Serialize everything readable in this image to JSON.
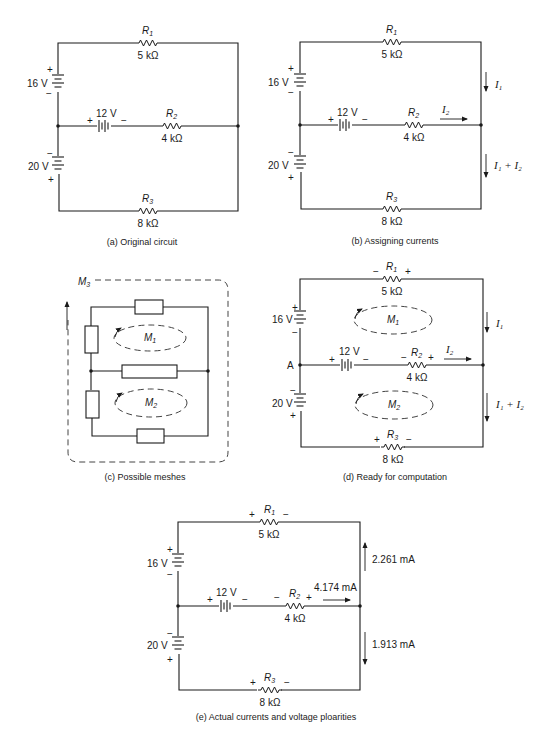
{
  "figure": {
    "panels": [
      {
        "id": "a",
        "caption": "(a)  Original circuit",
        "R1": {
          "name": "R",
          "sub": "1",
          "value": "5 kΩ"
        },
        "R2": {
          "name": "R",
          "sub": "2",
          "value": "4 kΩ"
        },
        "R3": {
          "name": "R",
          "sub": "3",
          "value": "8 kΩ"
        },
        "V16": {
          "value": "16 V",
          "top": "+",
          "bottom": "−"
        },
        "V20": {
          "value": "20 V",
          "top": "−",
          "bottom": "+"
        },
        "V12": {
          "value": "12 V",
          "left": "+",
          "right": "−"
        }
      },
      {
        "id": "b",
        "caption": "(b)  Assigning currents",
        "R1": {
          "name": "R",
          "sub": "1",
          "value": "5 kΩ"
        },
        "R2": {
          "name": "R",
          "sub": "2",
          "value": "4 kΩ"
        },
        "R3": {
          "name": "R",
          "sub": "3",
          "value": "8 kΩ"
        },
        "V16": {
          "value": "16 V",
          "top": "+",
          "bottom": "−"
        },
        "V20": {
          "value": "20 V",
          "top": "−",
          "bottom": "+"
        },
        "V12": {
          "value": "12 V",
          "left": "+",
          "right": "−"
        },
        "currents": {
          "I1": "I",
          "I1_sub": "1",
          "I2": "I",
          "I2_sub": "2",
          "I1plusI2": "I₁ + I₂"
        }
      },
      {
        "id": "c",
        "caption": "(c)  Possible meshes",
        "meshes": {
          "M1": "M",
          "M1_sub": "1",
          "M2": "M",
          "M2_sub": "2",
          "M3": "M",
          "M3_sub": "3"
        }
      },
      {
        "id": "d",
        "caption": "(d)  Ready for computation",
        "R1": {
          "name": "R",
          "sub": "1",
          "value": "5 kΩ",
          "left": "−",
          "right": "+"
        },
        "R2": {
          "name": "R",
          "sub": "2",
          "value": "4 kΩ",
          "left": "−",
          "right": "+"
        },
        "R3": {
          "name": "R",
          "sub": "3",
          "value": "8 kΩ",
          "left": "+",
          "right": "−"
        },
        "V16": {
          "value": "16 V",
          "top": "+",
          "bottom": "−"
        },
        "V20": {
          "value": "20 V",
          "top": "−",
          "bottom": "+"
        },
        "V12": {
          "value": "12 V",
          "left": "+",
          "right": "−"
        },
        "node": "A",
        "meshes": {
          "M1": "M",
          "M1_sub": "1",
          "M2": "M",
          "M2_sub": "2"
        },
        "currents": {
          "I1": "I",
          "I1_sub": "1",
          "I2": "I",
          "I2_sub": "2",
          "I1plusI2": "I₁ + I₂"
        }
      },
      {
        "id": "e",
        "caption": "(e)  Actual currents and voltage ploarities",
        "R1": {
          "name": "R",
          "sub": "1",
          "value": "5 kΩ",
          "left": "+",
          "right": "−"
        },
        "R2": {
          "name": "R",
          "sub": "2",
          "value": "4 kΩ",
          "left": "−",
          "right": "+"
        },
        "R3": {
          "name": "R",
          "sub": "3",
          "value": "8 kΩ",
          "left": "+",
          "right": "−"
        },
        "V16": {
          "value": "16 V",
          "top": "+",
          "bottom": "−"
        },
        "V20": {
          "value": "20 V",
          "top": "−",
          "bottom": "+"
        },
        "V12": {
          "value": "12 V",
          "left": "+",
          "right": "−"
        },
        "currents": {
          "top_right": "2.261 mA",
          "middle": "4.174 mA",
          "bottom_right": "1.913 mA"
        }
      }
    ]
  }
}
